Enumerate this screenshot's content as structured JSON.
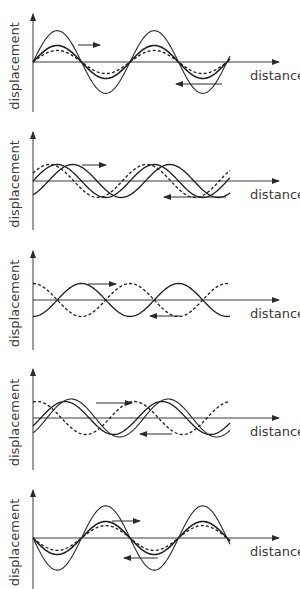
{
  "figure": {
    "panels": [
      {
        "id": 1,
        "xlabel": "distance",
        "ylabel": "displacement",
        "description": "constructive superposition",
        "waves": [
          {
            "name": "wave-right",
            "style": "thick",
            "amplitude": 1.0,
            "phase": 0,
            "direction": "right"
          },
          {
            "name": "wave-left",
            "style": "dashed",
            "amplitude": 0.7,
            "phase": 0,
            "direction": "left"
          },
          {
            "name": "resultant",
            "style": "thin",
            "amplitude": 1.9,
            "phase": 0
          }
        ]
      },
      {
        "id": 2,
        "xlabel": "distance",
        "ylabel": "displacement",
        "description": "waves out of phase (shifted)",
        "waves": [
          {
            "name": "wave-1",
            "style": "solid",
            "amplitude": 1.0,
            "phase": 0,
            "direction": "right"
          },
          {
            "name": "wave-2",
            "style": "dashed",
            "amplitude": 1.0,
            "phase": 0.5
          },
          {
            "name": "wave-3",
            "style": "solid",
            "amplitude": 1.0,
            "phase": -1.0,
            "direction": "left"
          }
        ]
      },
      {
        "id": 3,
        "xlabel": "distance",
        "ylabel": "displacement",
        "description": "antiphase waves",
        "waves": [
          {
            "name": "wave-right",
            "style": "solid",
            "amplitude": 1.0,
            "phase": -1.5708,
            "direction": "right"
          },
          {
            "name": "wave-left",
            "style": "dashed",
            "amplitude": 1.0,
            "phase": 1.5708,
            "direction": "left"
          }
        ]
      },
      {
        "id": 4,
        "xlabel": "distance",
        "ylabel": "displacement",
        "description": "partially shifted superposition",
        "waves": [
          {
            "name": "wave-right",
            "style": "solid",
            "amplitude": 1.0,
            "phase": -0.5,
            "direction": "right"
          },
          {
            "name": "wave-left",
            "style": "dashed",
            "amplitude": 1.0,
            "phase": 1.3,
            "direction": "left"
          },
          {
            "name": "resultant",
            "style": "thin",
            "amplitude": 1.15,
            "phase": -0.9
          }
        ]
      },
      {
        "id": 5,
        "xlabel": "distance",
        "ylabel": "displacement",
        "description": "constructive superposition (inverted start)",
        "waves": [
          {
            "name": "wave-right",
            "style": "thick",
            "amplitude": 1.0,
            "phase": 3.1416,
            "direction": "right"
          },
          {
            "name": "wave-left",
            "style": "dashed",
            "amplitude": 0.75,
            "phase": 3.1416,
            "direction": "left"
          },
          {
            "name": "resultant",
            "style": "thin",
            "amplitude": 1.95,
            "phase": 3.1416
          }
        ]
      }
    ]
  }
}
